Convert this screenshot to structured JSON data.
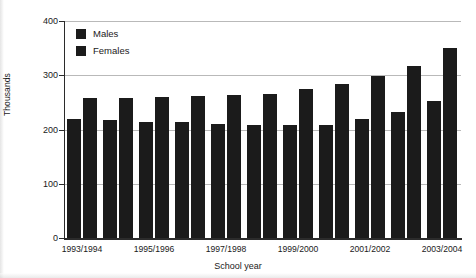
{
  "chart_data": {
    "type": "bar",
    "title": "",
    "xlabel": "School year",
    "ylabel": "Thousands",
    "ylim": [
      0,
      400
    ],
    "yticks": [
      0,
      100,
      200,
      300,
      400
    ],
    "ytick_labels": [
      "0",
      "100",
      "200",
      "300",
      "400"
    ],
    "grid": true,
    "legend_position": "top-left",
    "categories": [
      "1993/1994",
      "1994/1995",
      "1995/1996",
      "1996/1997",
      "1997/1998",
      "1998/1999",
      "1999/2000",
      "2000/2001",
      "2001/2002",
      "2002/2003",
      "2003/2004"
    ],
    "visible_xtick_labels": [
      "1993/1994",
      "1995/1996",
      "1997/1998",
      "1999/2000",
      "2001/2002",
      "2003/2004"
    ],
    "series": [
      {
        "name": "Males",
        "color": "#1b1b1b",
        "values": [
          220,
          217,
          214,
          213,
          210,
          208,
          209,
          209,
          219,
          232,
          252
        ]
      },
      {
        "name": "Females",
        "color": "#1b1b1b",
        "values": [
          258,
          258,
          260,
          261,
          263,
          266,
          275,
          284,
          298,
          318,
          350
        ]
      }
    ]
  },
  "legend": {
    "items": [
      {
        "label": "Males"
      },
      {
        "label": "Females"
      }
    ]
  },
  "axes": {
    "y_title": "Thousands",
    "x_title": "School year"
  }
}
